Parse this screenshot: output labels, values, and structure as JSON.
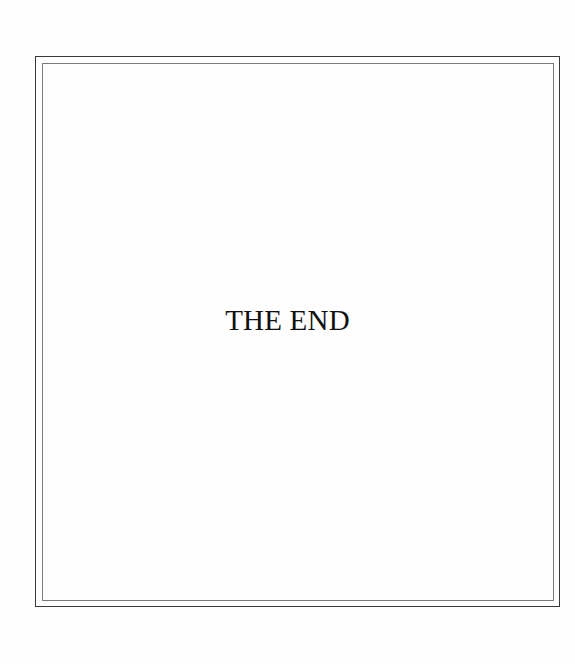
{
  "page": {
    "text": "THE END"
  },
  "colors": {
    "background": "#fefefe",
    "outer_border": "#3a3a3a",
    "inner_border": "#7a7a7a",
    "text": "#111111"
  }
}
